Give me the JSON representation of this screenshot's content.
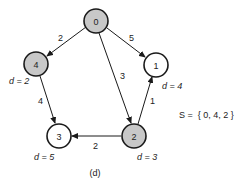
{
  "graph": {
    "nodes": [
      {
        "id": "0",
        "label": "0",
        "x": 96,
        "y": 21,
        "in_set": true,
        "distance": null
      },
      {
        "id": "1",
        "label": "1",
        "x": 156,
        "y": 65,
        "in_set": false,
        "distance": "d = 4"
      },
      {
        "id": "2",
        "label": "2",
        "x": 134,
        "y": 136,
        "in_set": true,
        "distance": "d = 3"
      },
      {
        "id": "3",
        "label": "3",
        "x": 59,
        "y": 136,
        "in_set": false,
        "distance": "d = 5"
      },
      {
        "id": "4",
        "label": "4",
        "x": 36,
        "y": 64,
        "in_set": true,
        "distance": "d = 2"
      }
    ],
    "edges": [
      {
        "from": "0",
        "to": "4",
        "weight": "2"
      },
      {
        "from": "0",
        "to": "1",
        "weight": "5"
      },
      {
        "from": "0",
        "to": "2",
        "weight": "3"
      },
      {
        "from": "4",
        "to": "3",
        "weight": "4"
      },
      {
        "from": "2",
        "to": "1",
        "weight": "1"
      },
      {
        "from": "2",
        "to": "3",
        "weight": "2"
      }
    ]
  },
  "labels": {
    "d4": "d = 2",
    "d1": "d = 4",
    "d3": "d = 5",
    "d2": "d = 3",
    "set": "S =  { 0, 4, 2 }",
    "caption": "(d)"
  },
  "colors": {
    "visited_fill": "#c8c8c8",
    "unvisited_fill": "#ffffff",
    "stroke": "#1a1a1a"
  }
}
